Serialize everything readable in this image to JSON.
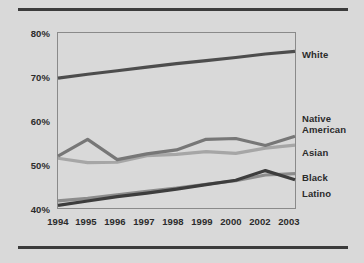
{
  "chart_data": {
    "type": "line",
    "title": "",
    "xlabel": "",
    "ylabel": "",
    "x": [
      "1994",
      "1995",
      "1996",
      "1997",
      "1998",
      "1999",
      "2000",
      "2002",
      "2003"
    ],
    "ylim": [
      40,
      80
    ],
    "yticks": [
      40,
      50,
      60,
      70,
      80
    ],
    "ytick_labels": [
      "40%",
      "50%",
      "60%",
      "70%",
      "80%"
    ],
    "grid": false,
    "legend_position": "right-of-axes",
    "series": [
      {
        "name": "White",
        "color": "#4d4d4d",
        "label": "White",
        "values": [
          69.5,
          70.4,
          71.2,
          72.0,
          72.8,
          73.5,
          74.2,
          75.0,
          75.6
        ]
      },
      {
        "name": "Native American",
        "color": "#777777",
        "label": "Native American",
        "label_line1": "Native",
        "label_line2": "American",
        "values": [
          51.8,
          55.6,
          51.0,
          52.3,
          53.2,
          55.6,
          55.8,
          54.2,
          56.3
        ]
      },
      {
        "name": "Asian",
        "color": "#a6a6a6",
        "label": "Asian",
        "values": [
          51.3,
          50.3,
          50.4,
          51.9,
          52.2,
          52.8,
          52.4,
          53.6,
          54.3
        ]
      },
      {
        "name": "Black",
        "color": "#8c8c8c",
        "label": "Black",
        "values": [
          41.6,
          42.2,
          43.0,
          43.8,
          44.5,
          45.4,
          46.2,
          47.5,
          47.8
        ]
      },
      {
        "name": "Latino",
        "color": "#3d3d3d",
        "label": "Latino",
        "values": [
          40.6,
          41.6,
          42.6,
          43.4,
          44.3,
          45.3,
          46.3,
          48.5,
          46.4
        ]
      }
    ]
  },
  "axes": {
    "ytick_labels": [
      "80%",
      "70%",
      "60%",
      "50%",
      "40%"
    ],
    "xtick_labels": [
      "1994",
      "1995",
      "1996",
      "1997",
      "1998",
      "1999",
      "2000",
      "2002",
      "2003"
    ]
  },
  "labels": {
    "white": "White",
    "native_line1": "Native",
    "native_line2": "American",
    "asian": "Asian",
    "black": "Black",
    "latino": "Latino"
  },
  "colors": {
    "background": "#d9d9d9",
    "rule": "#3b3b3b",
    "axis_box": "#808080",
    "white_series": "#4d4d4d",
    "native_series": "#777777",
    "asian_series": "#a6a6a6",
    "black_series": "#8c8c8c",
    "latino_series": "#3d3d3d"
  }
}
